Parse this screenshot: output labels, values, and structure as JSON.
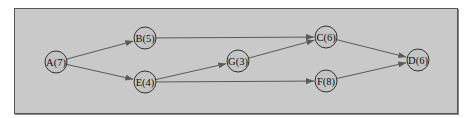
{
  "diagram": {
    "type": "activity-network",
    "colors": {
      "background": "#c9c9c9",
      "frame_border": "#555555",
      "node_fill": "#c4c4c4",
      "node_stroke": "#333333",
      "edge": "#5a5a5a"
    },
    "nodes": [
      {
        "id": "A",
        "label": "A(7)",
        "x": 56,
        "y": 62
      },
      {
        "id": "B",
        "label": "B(5)",
        "x": 145,
        "y": 38
      },
      {
        "id": "E",
        "label": "E(4)",
        "x": 145,
        "y": 82
      },
      {
        "id": "G",
        "label": "G(3)",
        "x": 238,
        "y": 61
      },
      {
        "id": "C",
        "label": "C(6)",
        "x": 326,
        "y": 37
      },
      {
        "id": "F",
        "label": "F(8)",
        "x": 326,
        "y": 81
      },
      {
        "id": "D",
        "label": "D(6)",
        "x": 418,
        "y": 60
      }
    ],
    "edges": [
      {
        "from": "A",
        "to": "B"
      },
      {
        "from": "A",
        "to": "E"
      },
      {
        "from": "B",
        "to": "C"
      },
      {
        "from": "E",
        "to": "G"
      },
      {
        "from": "E",
        "to": "F"
      },
      {
        "from": "G",
        "to": "C"
      },
      {
        "from": "C",
        "to": "D"
      },
      {
        "from": "F",
        "to": "D"
      }
    ]
  }
}
